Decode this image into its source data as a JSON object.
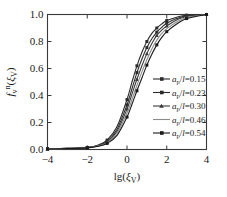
{
  "chart_data": {
    "type": "line",
    "title": "",
    "subtitle": "",
    "xlabel": "lg(ξ_V)",
    "xlabel_parts": {
      "main": "lg(",
      "italic": "ξ",
      "sub": "V",
      "close": ")"
    },
    "ylabel": "f_v^n(ξ_V)",
    "ylabel_parts": {
      "main": "f",
      "sub": "v",
      "sup": "n",
      "arg_open": "(",
      "arg_italic": "ξ",
      "arg_sub": "V",
      "arg_close": ")"
    },
    "xlim": [
      -4,
      4
    ],
    "ylim": [
      0.0,
      1.0
    ],
    "xticks": [
      -4,
      -2,
      0,
      2,
      4
    ],
    "xtick_labels": [
      "−4",
      "−2",
      "0",
      "2",
      "4"
    ],
    "yticks": [
      0.0,
      0.2,
      0.4,
      0.6,
      0.8,
      1.0
    ],
    "ytick_labels": [
      "0.0",
      "0.2",
      "0.4",
      "0.6",
      "0.8",
      "1.0"
    ],
    "grid": false,
    "legend_position": "center-right",
    "legend_title": "",
    "x": [
      -4,
      -3,
      -2,
      -1.5,
      -1,
      -0.5,
      0,
      0.25,
      0.5,
      0.75,
      1,
      1.25,
      1.5,
      1.75,
      2,
      2.5,
      3,
      4
    ],
    "series": [
      {
        "name": "a_p/l=0.15",
        "label_parts": {
          "italic1": "a",
          "sub1": "p",
          "slash": "/",
          "italic2": "l",
          "equals": "=",
          "value": "0.15"
        },
        "color": "#2b2b2b",
        "marker": "square",
        "values": [
          0.005,
          0.008,
          0.015,
          0.03,
          0.07,
          0.17,
          0.37,
          0.5,
          0.62,
          0.72,
          0.8,
          0.86,
          0.9,
          0.93,
          0.955,
          0.98,
          0.995,
          1.0
        ]
      },
      {
        "name": "a_p/l=0.23",
        "label_parts": {
          "italic1": "a",
          "sub1": "p",
          "slash": "/",
          "italic2": "l",
          "equals": "=",
          "value": "0.23"
        },
        "color": "#2b2b2b",
        "marker": "square",
        "values": [
          0.005,
          0.008,
          0.015,
          0.028,
          0.06,
          0.15,
          0.33,
          0.45,
          0.57,
          0.67,
          0.755,
          0.82,
          0.87,
          0.905,
          0.935,
          0.97,
          0.99,
          1.0
        ]
      },
      {
        "name": "a_p/l=0.30",
        "label_parts": {
          "italic1": "a",
          "sub1": "p",
          "slash": "/",
          "italic2": "l",
          "equals": "=",
          "value": "0.30"
        },
        "color": "#3a3a3a",
        "marker": "triangle",
        "values": [
          0.005,
          0.008,
          0.014,
          0.026,
          0.055,
          0.135,
          0.3,
          0.41,
          0.52,
          0.62,
          0.71,
          0.785,
          0.845,
          0.885,
          0.915,
          0.96,
          0.985,
          1.0
        ]
      },
      {
        "name": "a_p/l=0.46",
        "label_parts": {
          "italic1": "a",
          "sub1": "p",
          "slash": "/",
          "italic2": "l",
          "equals": "=",
          "value": "0.46"
        },
        "color": "#8c8c8c",
        "marker": "none",
        "values": [
          0.004,
          0.007,
          0.013,
          0.024,
          0.05,
          0.12,
          0.27,
          0.37,
          0.475,
          0.575,
          0.665,
          0.745,
          0.81,
          0.86,
          0.895,
          0.945,
          0.978,
          1.0
        ]
      },
      {
        "name": "a_p/l=0.54",
        "label_parts": {
          "italic1": "a",
          "sub1": "p",
          "slash": "/",
          "italic2": "l",
          "equals": "=",
          "value": "0.54"
        },
        "color": "#1a1a1a",
        "marker": "square",
        "values": [
          0.004,
          0.007,
          0.012,
          0.022,
          0.045,
          0.105,
          0.24,
          0.335,
          0.435,
          0.53,
          0.625,
          0.705,
          0.775,
          0.83,
          0.873,
          0.93,
          0.97,
          1.0
        ]
      }
    ]
  },
  "figure": {
    "background_color": "#ffffff",
    "axis_color": "#3a3a3a"
  }
}
